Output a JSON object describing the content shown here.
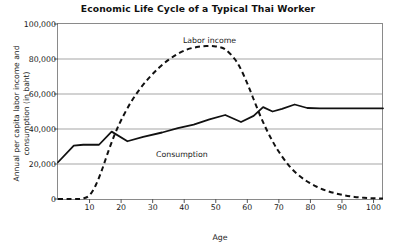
{
  "chart_data": {
    "type": "line",
    "title": "Economic Life Cycle of a Typical Thai Worker",
    "xlabel": "Age",
    "ylabel": "Annual per capita labor income and consumption (in baht)",
    "ylabel_line1": "Annual per capita labor income and",
    "ylabel_line2": "consumption (in baht)",
    "xlim": [
      0,
      103
    ],
    "ylim": [
      0,
      100000
    ],
    "grid": "horizontal",
    "legend_position": "inline-annotations",
    "x_ticks": [
      10,
      20,
      30,
      40,
      50,
      60,
      70,
      80,
      90,
      100
    ],
    "x_tick_labels": [
      "10",
      "20",
      "30",
      "40",
      "50",
      "60",
      "70",
      "80",
      "90",
      "100"
    ],
    "y_ticks": [
      0,
      20000,
      40000,
      60000,
      80000,
      100000
    ],
    "y_tick_labels": [
      "0",
      "20,000",
      "40,000",
      "60,000",
      "80,000",
      "100,000"
    ],
    "series": [
      {
        "name": "Labor income",
        "style": "dashed",
        "color": "#111111",
        "x": [
          0,
          3,
          6,
          8,
          10,
          12,
          14,
          16,
          18,
          20,
          23,
          26,
          29,
          32,
          35,
          38,
          41,
          44,
          47,
          50,
          53,
          56,
          58,
          60,
          62,
          64,
          66,
          68,
          70,
          73,
          76,
          79,
          82,
          85,
          88,
          91,
          94,
          97,
          100,
          103
        ],
        "y": [
          0,
          0,
          0,
          300,
          2200,
          8000,
          17000,
          27500,
          37000,
          45000,
          55000,
          63000,
          69500,
          75000,
          79500,
          83000,
          85500,
          86800,
          87400,
          87200,
          85500,
          80000,
          74000,
          66000,
          57000,
          48000,
          40000,
          33000,
          27000,
          19500,
          14000,
          10000,
          7000,
          4800,
          3200,
          2000,
          1200,
          700,
          400,
          300
        ]
      },
      {
        "name": "Consumption",
        "style": "solid",
        "color": "#111111",
        "x": [
          0,
          5,
          8,
          13,
          17,
          22,
          27,
          33,
          38,
          43,
          48,
          53,
          58,
          62,
          65,
          68,
          71,
          75,
          79,
          83,
          90,
          100,
          103
        ],
        "y": [
          21000,
          30500,
          31000,
          31000,
          38500,
          33000,
          35500,
          38000,
          40500,
          42500,
          45500,
          48000,
          44000,
          47500,
          52500,
          50000,
          51500,
          54000,
          52000,
          51800,
          51800,
          51800,
          51800
        ]
      }
    ],
    "annotations": [
      {
        "text": "Labor income",
        "series": "Labor income"
      },
      {
        "text": "Consumption",
        "series": "Consumption"
      }
    ]
  }
}
